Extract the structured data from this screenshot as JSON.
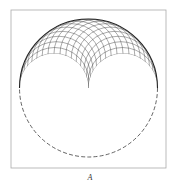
{
  "figure": {
    "caption": "A",
    "frame": {
      "x": 11,
      "y": 10,
      "width": 155,
      "height": 158,
      "stroke": "#aaaaaa"
    },
    "outer_circle": {
      "cx": 88.5,
      "cy": 88,
      "r": 69,
      "lower_half_style": "dashed",
      "upper_half_style": "solid",
      "stroke": "#222222"
    },
    "grid": {
      "description": "Family of circles of radius r/2 passing through the center, forming a lens-shaped grid in the upper half with a cusp at the center",
      "count": 19,
      "stroke": "#444444"
    }
  }
}
